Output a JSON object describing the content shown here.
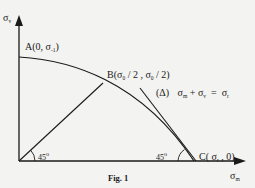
{
  "figure": {
    "caption": "Fig. 1",
    "axes": {
      "y_symbol": "σ",
      "y_sub": "v",
      "x_symbol": "σ",
      "x_sub": "m"
    },
    "points": {
      "A": {
        "name": "A",
        "open": "(0, ",
        "sym": "σ",
        "sub": "-1",
        "close": ")"
      },
      "B": {
        "name": "B",
        "open": "(",
        "sym1": "σ",
        "sub1": "0",
        "mid": " / 2 , ",
        "sym2": "σ",
        "sub2": "0",
        "close": " / 2)"
      },
      "C": {
        "name": "C",
        "open": "( ",
        "sym": "σ",
        "sub": "r",
        "close": " , 0)"
      }
    },
    "line_delta": {
      "label": "(Δ)",
      "eq_s1": "σ",
      "eq_sub1": "m",
      "plus": " + ",
      "eq_s2": "σ",
      "eq_sub2": "v",
      "equals": "  =  ",
      "eq_s3": "σ",
      "eq_sub3": "r"
    },
    "angles": {
      "origin": {
        "value": "45",
        "unit": "o"
      },
      "c_point": {
        "value": "45",
        "unit": "o"
      }
    },
    "colors": {
      "ink": "#1a1a1a",
      "paper": "#f3f3f1"
    }
  }
}
